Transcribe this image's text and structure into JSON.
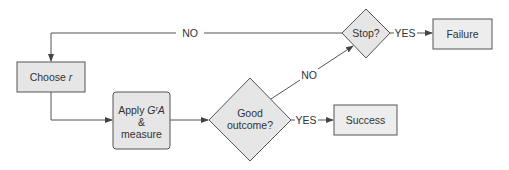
{
  "diagram": {
    "type": "flowchart",
    "colors": {
      "node_fill": "#e6e6e6",
      "terminal_fill": "#ededed",
      "stroke": "#555555",
      "text": "#333333",
      "background": "#ffffff"
    },
    "nodes": {
      "choose": {
        "label_prefix": "Choose ",
        "label_var": "r"
      },
      "apply": {
        "line1_prefix": "Apply ",
        "line1_var": "GʳA",
        "line2": "&",
        "line3": "measure"
      },
      "good": {
        "line1": "Good",
        "line2": "outcome?"
      },
      "stop": {
        "label": "Stop?"
      },
      "failure": {
        "label": "Failure"
      },
      "success": {
        "label": "Success"
      }
    },
    "edges": {
      "stop_no": "NO",
      "good_no": "NO",
      "stop_yes": "YES",
      "good_yes": "YES"
    }
  }
}
